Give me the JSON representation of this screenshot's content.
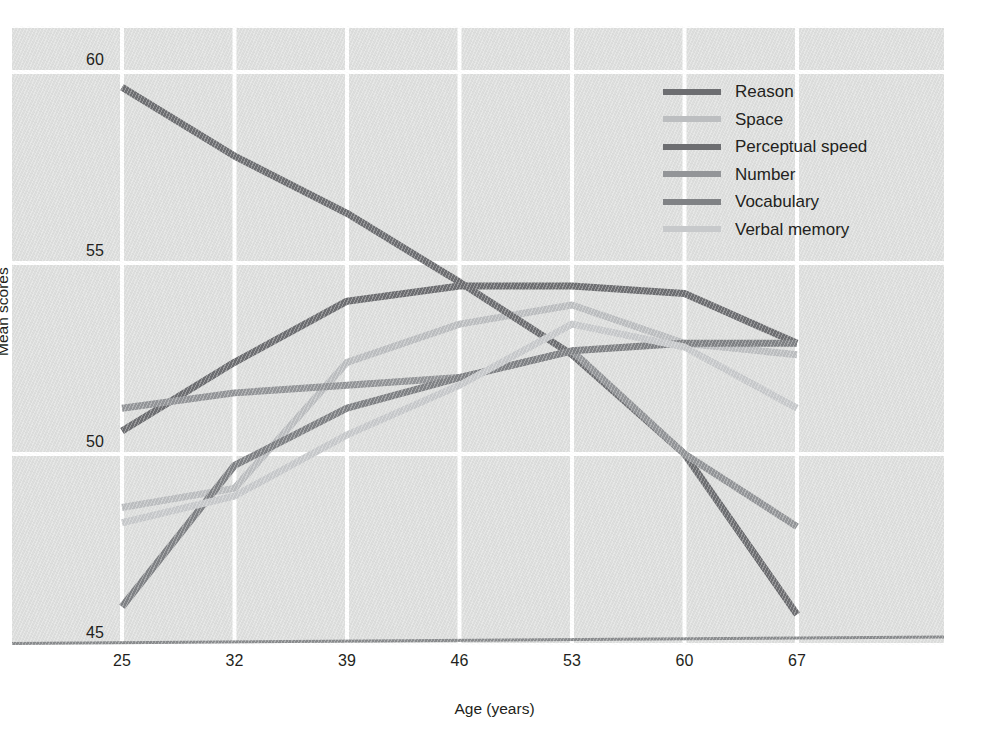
{
  "chart_data": {
    "type": "line",
    "title": "",
    "xlabel": "Age (years)",
    "ylabel": "Mean scores",
    "x": [
      25,
      32,
      39,
      46,
      53,
      60,
      67
    ],
    "xticklabels": [
      "25",
      "32",
      "39",
      "46",
      "53",
      "60",
      "67"
    ],
    "yticks": [
      45,
      50,
      55,
      60
    ],
    "yticklabels": [
      "45",
      "50",
      "55",
      "60"
    ],
    "ylim": [
      44.0,
      60.5
    ],
    "xlim": [
      22.0,
      70.5
    ],
    "grid": "white gridlines on grey panel, both axes",
    "legend_position": "upper right inside plot area",
    "series": [
      {
        "name": "Reason",
        "color": "#6d6e71",
        "values": [
          50.6,
          52.4,
          54.0,
          54.4,
          54.4,
          54.2,
          52.9
        ]
      },
      {
        "name": "Space",
        "color": "#bcbec0",
        "values": [
          48.6,
          49.1,
          52.4,
          53.4,
          53.9,
          52.9,
          52.6
        ]
      },
      {
        "name": "Perceptual speed",
        "color": "#6d6e71",
        "values": [
          59.6,
          57.8,
          56.3,
          54.5,
          52.6,
          50.0,
          45.8
        ]
      },
      {
        "name": "Number",
        "color": "#939598",
        "values": [
          51.2,
          51.6,
          51.8,
          52.0,
          52.7,
          50.0,
          48.1
        ]
      },
      {
        "name": "Vocabulary",
        "color": "#808285",
        "values": [
          46.0,
          49.7,
          51.2,
          52.0,
          52.7,
          52.9,
          52.9
        ]
      },
      {
        "name": "Verbal memory",
        "color": "#c7c9cb",
        "values": [
          48.2,
          48.9,
          50.5,
          51.8,
          53.4,
          52.8,
          51.2
        ]
      }
    ]
  },
  "axes": {
    "ylabel": "Mean scores",
    "xlabel": "Age (years)"
  },
  "legend": {
    "items": [
      {
        "label": "Reason"
      },
      {
        "label": "Space"
      },
      {
        "label": "Perceptual speed"
      },
      {
        "label": "Number"
      },
      {
        "label": "Vocabulary"
      },
      {
        "label": "Verbal memory"
      }
    ]
  },
  "style": {
    "panel_bg": "#dddedd",
    "grid_color": "#ffffff",
    "baseline_color": "#8a8c8e",
    "text_color": "#231f20"
  }
}
